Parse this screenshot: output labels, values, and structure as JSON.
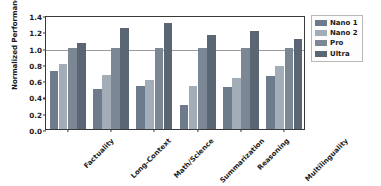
{
  "chart_data": {
    "type": "bar",
    "title": "",
    "xlabel": "",
    "ylabel": "Normalized Performance vs Pro",
    "ylim": [
      0.0,
      1.4
    ],
    "yticks": [
      "0.0",
      "0.2",
      "0.4",
      "0.6",
      "0.8",
      "1.0",
      "1.2",
      "1.4"
    ],
    "ytick_values": [
      0.0,
      0.2,
      0.4,
      0.6,
      0.8,
      1.0,
      1.2,
      1.4
    ],
    "grid": false,
    "legend_position": "right-outside",
    "reference_line": 1.0,
    "categories": [
      "Factuality",
      "Long-Context",
      "Math/Science",
      "Summarization",
      "Reasoning",
      "Multilinguality"
    ],
    "series": [
      {
        "name": "Nano 1",
        "color": "#6d7b8d",
        "values": [
          0.71,
          0.49,
          0.53,
          0.29,
          0.51,
          0.65
        ]
      },
      {
        "name": "Nano 2",
        "color": "#a3adb8",
        "values": [
          0.8,
          0.66,
          0.6,
          0.53,
          0.63,
          0.77
        ]
      },
      {
        "name": "Pro",
        "color": "#7b8794",
        "values": [
          1.0,
          1.0,
          1.0,
          1.0,
          1.0,
          1.0
        ]
      },
      {
        "name": "Ultra",
        "color": "#5a6673",
        "values": [
          1.06,
          1.24,
          1.3,
          1.16,
          1.2,
          1.11
        ]
      }
    ]
  },
  "legend": {
    "items": [
      {
        "label": "Nano 1"
      },
      {
        "label": "Nano 2"
      },
      {
        "label": "Pro"
      },
      {
        "label": "Ultra"
      }
    ]
  }
}
